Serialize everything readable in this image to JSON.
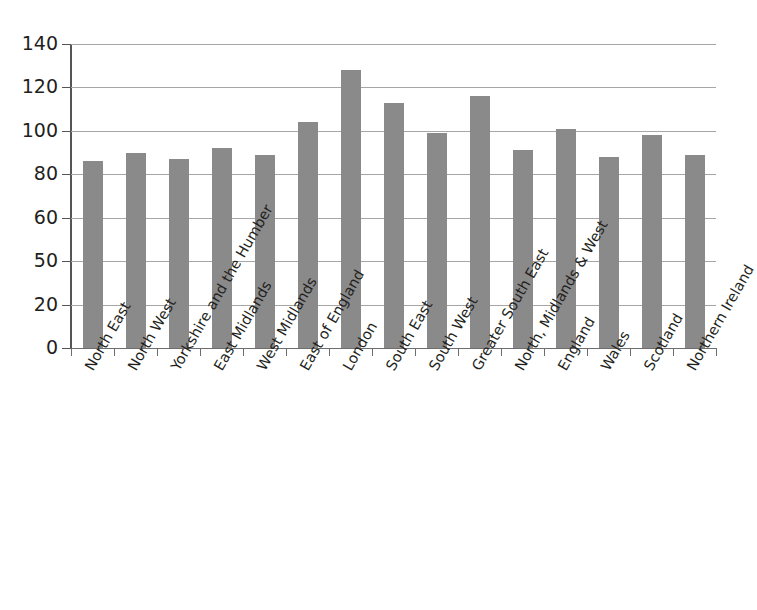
{
  "chart_data": {
    "type": "bar",
    "title": "",
    "xlabel": "",
    "ylabel": "",
    "ylim": [
      0,
      140
    ],
    "grid": true,
    "legend": false,
    "bar_color": "#8a8a8a",
    "axis_color": "#555555",
    "gridline_color": "#a6a6a6",
    "y_ticks": [
      "140",
      "120",
      "100",
      "80",
      "60",
      "50",
      "20",
      "0"
    ],
    "y_tick_values": [
      140,
      120,
      100,
      80,
      60,
      50,
      20,
      0
    ],
    "categories": [
      "North East",
      "North West",
      "Yorkshire and the Humber",
      "East Midlands",
      "West Midlands",
      "East of England",
      "London",
      "South East",
      "South West",
      "Greater South East",
      "North, Midlands & West",
      "England",
      "Wales",
      "Scotland",
      "Northern Ireland"
    ],
    "values": [
      86,
      90,
      87,
      92,
      89,
      104,
      128,
      113,
      99,
      116,
      91,
      101,
      88,
      98,
      89
    ]
  },
  "header": {
    "title": ""
  }
}
